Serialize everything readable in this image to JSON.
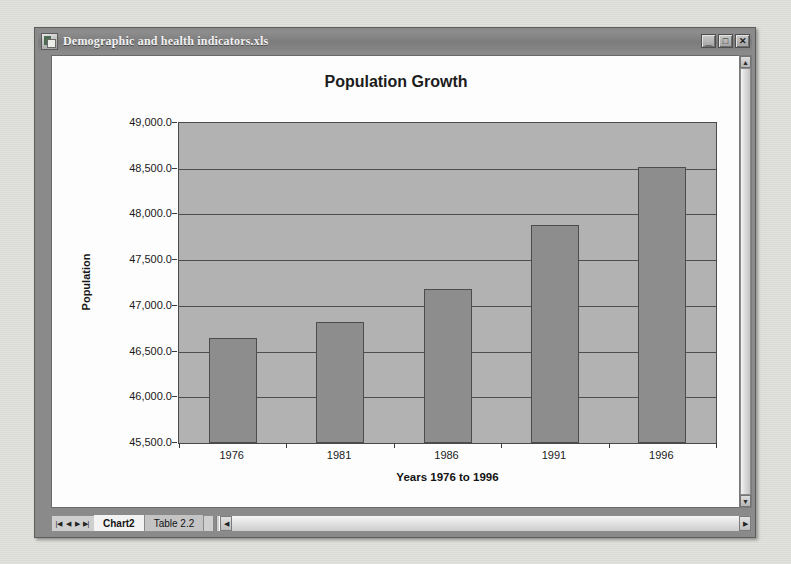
{
  "window": {
    "title": "Demographic and health indicators.xls",
    "icon": "excel-document-icon",
    "buttons": {
      "minimize": "_",
      "maximize": "□",
      "close": "✕"
    }
  },
  "sheet_tabs": {
    "nav": [
      "|◀",
      "◀",
      "▶",
      "▶|"
    ],
    "items": [
      {
        "label": "Chart2",
        "active": true
      },
      {
        "label": "Table 2.2",
        "active": false
      }
    ]
  },
  "scrollbars": {
    "vertical": {
      "up": "▲",
      "down": "▼"
    },
    "horizontal": {
      "left": "◀",
      "right": "▶"
    }
  },
  "chart_data": {
    "type": "bar",
    "title": "Population Growth",
    "xlabel": "Years 1976 to 1996",
    "ylabel": "Population",
    "categories": [
      "1976",
      "1981",
      "1986",
      "1991",
      "1996"
    ],
    "values": [
      46650,
      46820,
      47190,
      47880,
      48520
    ],
    "ylim": [
      45500,
      49000
    ],
    "ytick_labels": [
      "49,000.0",
      "48,500.0",
      "48,000.0",
      "47,500.0",
      "47,000.0",
      "46,500.0",
      "46,000.0",
      "45,500.0"
    ],
    "yticks": [
      49000,
      48500,
      48000,
      47500,
      47000,
      46500,
      46000,
      45500
    ],
    "grid": true,
    "legend": false,
    "colors": {
      "bar_fill": "#8d8d8d",
      "bar_border": "#4c4c4c",
      "plot_background": "#b2b2b2",
      "gridline": "#4e4e4e",
      "chart_background": "#fdfdfd"
    }
  }
}
